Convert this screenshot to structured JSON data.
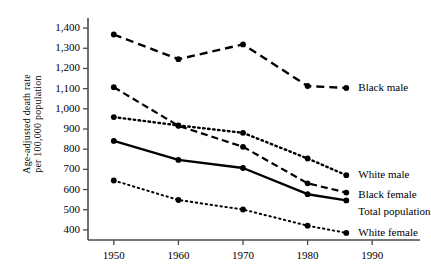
{
  "chart_data": {
    "type": "line",
    "title": "",
    "xlabel": "",
    "ylabel": "Age-adjusted death rate per 100,000 population",
    "ylabel_line1": "Age-adjusted death rate",
    "ylabel_line2": "per 100,000 population",
    "x": [
      1950,
      1960,
      1970,
      1980,
      1986
    ],
    "xlim": [
      1946,
      1994
    ],
    "ylim": [
      350,
      1450
    ],
    "xticks": [
      "1950",
      "1960",
      "1970",
      "1980",
      "1990"
    ],
    "xtick_values": [
      1950,
      1960,
      1970,
      1980,
      1990
    ],
    "yticks": [
      "400",
      "500",
      "600",
      "700",
      "800",
      "900",
      "1,000",
      "1,100",
      "1,200",
      "1,300",
      "1,400"
    ],
    "ytick_values": [
      400,
      500,
      600,
      700,
      800,
      900,
      1000,
      1100,
      1200,
      1300,
      1400
    ],
    "grid": false,
    "legend_position": "right-inline-labels",
    "series": [
      {
        "name": "Black male",
        "label": "Black male",
        "style": "dashed-thick",
        "color": "#000000",
        "values": [
          1368,
          1246,
          1319,
          1113,
          1103
        ]
      },
      {
        "name": "Black female",
        "label": "Black female",
        "style": "dashed",
        "color": "#000000",
        "values": [
          1107,
          916,
          812,
          631,
          585
        ]
      },
      {
        "name": "White male",
        "label": "White male",
        "style": "dotted-bold",
        "color": "#000000",
        "values": [
          959,
          918,
          881,
          754,
          671
        ]
      },
      {
        "name": "Total population",
        "label": "Total population",
        "style": "solid",
        "color": "#000000",
        "values": [
          841,
          747,
          707,
          577,
          546
        ]
      },
      {
        "name": "White female",
        "label": "White female",
        "style": "dotted-fine",
        "color": "#000000",
        "values": [
          645,
          548,
          501,
          421,
          385
        ]
      }
    ]
  }
}
